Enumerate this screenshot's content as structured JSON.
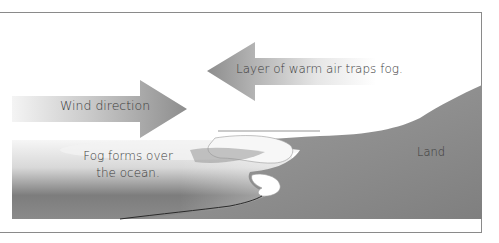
{
  "diagram": {
    "labels": {
      "wind": "Wind direction",
      "warm_layer": "Layer of warm air traps fog.",
      "fog": "Fog forms over the ocean.",
      "land": "Land"
    },
    "arrows": [
      {
        "name": "wind-direction-arrow",
        "direction": "right"
      },
      {
        "name": "warm-air-layer-arrow",
        "direction": "left"
      }
    ],
    "colors": {
      "arrow_dark": "#8c8c8c",
      "arrow_light": "#f2f2f2",
      "land": "#8e8e8e",
      "ocean_dark": "#6e6e6e",
      "fog": "#f4f4f4",
      "frame": "#8a8a8a",
      "text": "#3a3a3a"
    }
  }
}
